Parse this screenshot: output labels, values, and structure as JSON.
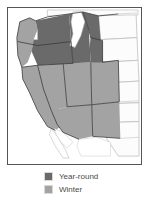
{
  "figure": {
    "type": "distribution-map",
    "region": "Western United States"
  },
  "legend": {
    "items": [
      {
        "label": "Year-round",
        "color": "#6a6a6a",
        "swatch_icon": "color-swatch-icon"
      },
      {
        "label": "Winter",
        "color": "#a3a3a3",
        "swatch_icon": "color-swatch-icon"
      }
    ]
  },
  "map": {
    "colors": {
      "year_round": "#6a6a6a",
      "winter": "#a3a3a3",
      "unshaded_land": "#fcfcfc",
      "water": "#ffffff",
      "state_border": "#3a3a3a",
      "outer_border": "#555555",
      "faint_border": "#b5b5b5"
    },
    "shaded_year_round": [
      "Washington (interior)",
      "Oregon (interior)",
      "Idaho",
      "Montana (western)",
      "Wyoming"
    ],
    "shaded_winter": [
      "Washington (coastal)",
      "Oregon (coastal)",
      "California",
      "Nevada",
      "Utah",
      "Colorado",
      "Arizona",
      "New Mexico"
    ],
    "unshaded": [
      "North Dakota",
      "South Dakota",
      "Nebraska",
      "Kansas",
      "Oklahoma",
      "Texas (western)"
    ]
  }
}
